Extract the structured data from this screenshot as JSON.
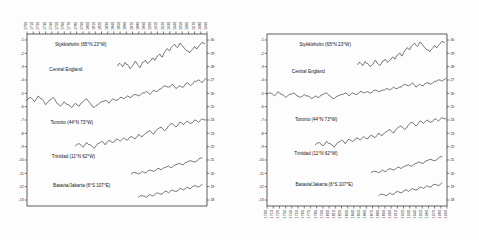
{
  "figure": {
    "title": "",
    "panels": [
      "left",
      "right"
    ]
  },
  "chart_data": {
    "type": "line",
    "title": "",
    "xlabel": "",
    "ylabel": "Temperature (°C)",
    "grid": false,
    "legend_position": "inline-labels",
    "panels": [
      {
        "name": "left",
        "xlabel_position": "top",
        "xlim": [
          1700,
          1990
        ],
        "x_ticks": [
          1700,
          1710,
          1720,
          1730,
          1740,
          1750,
          1760,
          1770,
          1780,
          1790,
          1800,
          1810,
          1820,
          1830,
          1840,
          1850,
          1860,
          1870,
          1880,
          1890,
          1900,
          1910,
          1920,
          1930,
          1940,
          1950,
          1960,
          1970,
          1980,
          1990
        ],
        "x_tick_labels": [
          "1700",
          "1710",
          "1720",
          "1730",
          "1740",
          "1750",
          "1760",
          "1770",
          "1780",
          "1790",
          "1800",
          "1810",
          "1820",
          "1830",
          "1840",
          "1850",
          "1860",
          "1870",
          "1880",
          "1890",
          "1900",
          "1910",
          "1920",
          "1930",
          "1940",
          "1950",
          "1960",
          "1970",
          "1980",
          "1990"
        ],
        "y_left_ticks": [
          -1,
          -2,
          -3,
          -4,
          -5,
          -6,
          -7,
          -8,
          -9,
          -10,
          -11,
          -12,
          -13
        ],
        "y_left_tick_labels": [
          "-1",
          "-2",
          "-3",
          "-4",
          "-5",
          "-6",
          "-7",
          "-8",
          "-9",
          "-10",
          "-11",
          "-12",
          "-13"
        ],
        "y_right_ticks": [
          30,
          29,
          28,
          27,
          26,
          25,
          24,
          23,
          22,
          21,
          20,
          19,
          18
        ],
        "y_right_tick_labels": [
          "30",
          "29",
          "28",
          "27",
          "26",
          "25",
          "24",
          "23",
          "22",
          "21",
          "20",
          "19",
          "18"
        ],
        "series": [
          {
            "name": "Stykkisholm (65°N 23°W)",
            "label": "Stykkisholm (65°N 23°W)",
            "label_x": 1745,
            "label_y_px": 46,
            "x": [
              1846,
              1850,
              1854,
              1858,
              1862,
              1866,
              1870,
              1874,
              1878,
              1882,
              1886,
              1890,
              1894,
              1898,
              1902,
              1906,
              1910,
              1914,
              1918,
              1922,
              1926,
              1930,
              1934,
              1938,
              1942,
              1946,
              1950,
              1954,
              1958,
              1962,
              1966,
              1970,
              1974,
              1978,
              1982,
              1986
            ],
            "values": [
              3.0,
              3.2,
              2.9,
              3.3,
              3.1,
              2.7,
              3.0,
              3.4,
              3.1,
              2.8,
              3.3,
              3.5,
              3.2,
              3.4,
              3.7,
              3.5,
              3.9,
              4.1,
              3.8,
              4.3,
              4.6,
              4.4,
              4.8,
              5.0,
              4.7,
              5.1,
              4.9,
              4.6,
              4.4,
              4.2,
              4.5,
              4.8,
              4.6,
              4.9,
              5.2,
              5.1
            ]
          },
          {
            "name": "Central England",
            "label": "Central England",
            "label_x": 1736,
            "label_y_px": 71,
            "x": [
              1700,
              1706,
              1712,
              1718,
              1724,
              1730,
              1736,
              1742,
              1748,
              1754,
              1760,
              1766,
              1772,
              1778,
              1784,
              1790,
              1796,
              1802,
              1808,
              1814,
              1820,
              1826,
              1832,
              1838,
              1844,
              1850,
              1856,
              1862,
              1868,
              1874,
              1880,
              1886,
              1892,
              1898,
              1904,
              1910,
              1916,
              1922,
              1928,
              1934,
              1940,
              1946,
              1952,
              1958,
              1964,
              1970,
              1976,
              1982,
              1988
            ],
            "values": [
              9.0,
              9.2,
              8.9,
              9.3,
              9.1,
              8.7,
              9.0,
              9.2,
              8.8,
              8.6,
              8.9,
              8.7,
              8.5,
              8.8,
              8.6,
              8.9,
              9.1,
              8.8,
              8.5,
              8.7,
              8.9,
              9.0,
              8.8,
              9.1,
              9.0,
              9.2,
              9.1,
              9.3,
              9.2,
              9.4,
              9.3,
              9.5,
              9.6,
              9.4,
              9.7,
              9.6,
              9.8,
              10.0,
              9.9,
              10.1,
              9.8,
              10.0,
              9.9,
              10.2,
              10.0,
              10.3,
              10.4,
              10.2,
              10.5
            ]
          },
          {
            "name": "Toronto (44°N 73°W)",
            "label": "Toronto (44°N 73°W)",
            "label_x": 1738,
            "label_y_px": 124,
            "x": [
              1778,
              1784,
              1790,
              1796,
              1802,
              1808,
              1814,
              1820,
              1826,
              1832,
              1838,
              1844,
              1850,
              1856,
              1862,
              1868,
              1874,
              1880,
              1886,
              1892,
              1898,
              1904,
              1910,
              1916,
              1922,
              1928,
              1934,
              1940,
              1946,
              1952,
              1958,
              1964,
              1970,
              1976,
              1982,
              1988
            ],
            "values": [
              6.8,
              7.0,
              6.7,
              7.1,
              6.9,
              6.6,
              7.0,
              7.2,
              6.9,
              7.3,
              7.1,
              7.4,
              7.2,
              7.5,
              7.3,
              7.6,
              7.4,
              7.8,
              7.6,
              7.9,
              8.1,
              7.8,
              8.2,
              8.4,
              8.1,
              8.5,
              8.7,
              8.4,
              8.8,
              8.6,
              8.9,
              8.7,
              9.0,
              8.8,
              9.1,
              9.0
            ]
          },
          {
            "name": "Trinidad (11°N 62°W)",
            "label": "Trinidad (11°N 62°W)",
            "label_x": 1740,
            "label_y_px": 158,
            "x": [
              1868,
              1874,
              1880,
              1886,
              1892,
              1898,
              1904,
              1910,
              1916,
              1922,
              1928,
              1934,
              1940,
              1946,
              1952,
              1958,
              1964,
              1970,
              1976,
              1982
            ],
            "values": [
              25.4,
              25.5,
              25.4,
              25.6,
              25.5,
              25.7,
              25.6,
              25.8,
              25.7,
              25.9,
              26.0,
              25.9,
              26.1,
              26.2,
              26.1,
              26.3,
              26.4,
              26.3,
              26.5,
              26.6
            ]
          },
          {
            "name": "Batavia/Jakarta (6°S 107°E)",
            "label": "Batavia/Jakarta (6°S 107°E)",
            "label_x": 1742,
            "label_y_px": 187,
            "x": [
              1880,
              1886,
              1892,
              1898,
              1904,
              1910,
              1916,
              1922,
              1928,
              1934,
              1940,
              1946,
              1952,
              1958,
              1964,
              1970,
              1976,
              1982
            ],
            "values": [
              25.8,
              25.9,
              25.8,
              26.0,
              25.9,
              26.1,
              26.0,
              26.2,
              26.1,
              26.3,
              26.2,
              26.4,
              26.3,
              26.5,
              26.4,
              26.6,
              26.5,
              26.7
            ]
          }
        ]
      },
      {
        "name": "right",
        "xlabel_position": "bottom",
        "xlim": [
          1700,
          1990
        ],
        "x_ticks": [
          1700,
          1710,
          1720,
          1730,
          1740,
          1750,
          1760,
          1770,
          1780,
          1790,
          1800,
          1810,
          1820,
          1830,
          1840,
          1850,
          1860,
          1870,
          1880,
          1890,
          1900,
          1910,
          1920,
          1930,
          1940,
          1950,
          1960,
          1970,
          1980,
          1990
        ],
        "x_tick_labels": [
          "1700",
          "1710",
          "1720",
          "1730",
          "1740",
          "1750",
          "1760",
          "1770",
          "1780",
          "1790",
          "1800",
          "1810",
          "1820",
          "1830",
          "1840",
          "1850",
          "1860",
          "1870",
          "1880",
          "1890",
          "1900",
          "1910",
          "1920",
          "1930",
          "1940",
          "1950",
          "1960",
          "1970",
          "1980",
          "1990"
        ],
        "y_left_ticks": [
          -1,
          -2,
          -3,
          -4,
          -5,
          -6,
          -7,
          -8,
          -9,
          -10,
          -11,
          -12,
          -13
        ],
        "y_left_tick_labels": [
          "-1",
          "-2",
          "-3",
          "-4",
          "-5",
          "-6",
          "-7",
          "-8",
          "-9",
          "-10",
          "-11",
          "-12",
          "-13"
        ],
        "y_right_ticks": [
          30,
          29,
          28,
          27,
          26,
          25,
          24,
          23,
          22,
          21,
          20,
          19,
          18
        ],
        "y_right_tick_labels": [
          "30",
          "29",
          "28",
          "27",
          "26",
          "25",
          "24",
          "23",
          "22",
          "21",
          "20",
          "19",
          "18"
        ],
        "series": [
          {
            "name": "Stykkisholm (65°N 23°W)",
            "label": "Stykkisholm (65°N 23°W)",
            "label_x": 1752,
            "label_y_px": 46,
            "x": [
              1846,
              1850,
              1854,
              1858,
              1862,
              1866,
              1870,
              1874,
              1878,
              1882,
              1886,
              1890,
              1894,
              1898,
              1902,
              1906,
              1910,
              1914,
              1918,
              1922,
              1926,
              1930,
              1934,
              1938,
              1942,
              1946,
              1950,
              1954,
              1958,
              1962,
              1966,
              1970,
              1974,
              1978,
              1982,
              1986
            ],
            "values": [
              3.1,
              3.3,
              3.0,
              3.4,
              3.2,
              2.9,
              3.1,
              3.5,
              3.2,
              3.0,
              3.4,
              3.6,
              3.3,
              3.5,
              3.8,
              3.6,
              4.0,
              4.2,
              3.9,
              4.4,
              4.7,
              4.5,
              4.9,
              5.1,
              4.8,
              5.2,
              5.0,
              4.7,
              4.5,
              4.3,
              4.6,
              4.9,
              4.7,
              5.0,
              5.3,
              5.2
            ]
          },
          {
            "name": "Central England",
            "label": "Central England",
            "label_x": 1740,
            "label_y_px": 73,
            "x": [
              1700,
              1706,
              1712,
              1718,
              1724,
              1730,
              1736,
              1742,
              1748,
              1754,
              1760,
              1766,
              1772,
              1778,
              1784,
              1790,
              1796,
              1802,
              1808,
              1814,
              1820,
              1826,
              1832,
              1838,
              1844,
              1850,
              1856,
              1862,
              1868,
              1874,
              1880,
              1886,
              1892,
              1898,
              1904,
              1910,
              1916,
              1922,
              1928,
              1934,
              1940,
              1946,
              1952,
              1958,
              1964,
              1970,
              1976,
              1982,
              1988
            ],
            "values": [
              9.4,
              9.5,
              9.3,
              9.6,
              9.4,
              9.2,
              9.4,
              9.5,
              9.3,
              9.2,
              9.4,
              9.3,
              9.1,
              9.3,
              9.2,
              9.4,
              9.5,
              9.3,
              9.1,
              9.3,
              9.4,
              9.5,
              9.3,
              9.5,
              9.4,
              9.6,
              9.5,
              9.6,
              9.5,
              9.7,
              9.6,
              9.7,
              9.8,
              9.7,
              9.9,
              9.8,
              9.9,
              10.1,
              10.0,
              10.2,
              9.9,
              10.1,
              10.0,
              10.2,
              10.1,
              10.3,
              10.4,
              10.3,
              10.5
            ]
          },
          {
            "name": "Toronto (44°N 73°W)",
            "label": "Toronto (44°N 73°W)",
            "label_x": 1745,
            "label_y_px": 121,
            "x": [
              1778,
              1784,
              1790,
              1796,
              1802,
              1808,
              1814,
              1820,
              1826,
              1832,
              1838,
              1844,
              1850,
              1856,
              1862,
              1868,
              1874,
              1880,
              1886,
              1892,
              1898,
              1904,
              1910,
              1916,
              1922,
              1928,
              1934,
              1940,
              1946,
              1952,
              1958,
              1964,
              1970,
              1976,
              1982,
              1988
            ],
            "values": [
              6.9,
              7.1,
              6.8,
              7.2,
              7.0,
              6.7,
              7.1,
              7.3,
              7.0,
              7.4,
              7.2,
              7.5,
              7.3,
              7.6,
              7.4,
              7.7,
              7.5,
              7.9,
              7.7,
              8.0,
              8.2,
              7.9,
              8.3,
              8.5,
              8.2,
              8.6,
              8.8,
              8.5,
              8.9,
              8.7,
              9.0,
              8.8,
              9.1,
              8.9,
              9.2,
              9.1
            ]
          },
          {
            "name": "Trinidad (11°N 62°W)",
            "label": "Trinidad (11°N 62°W)",
            "label_x": 1744,
            "label_y_px": 155,
            "x": [
              1868,
              1874,
              1880,
              1886,
              1892,
              1898,
              1904,
              1910,
              1916,
              1922,
              1928,
              1934,
              1940,
              1946,
              1952,
              1958,
              1964,
              1970,
              1976,
              1982
            ],
            "values": [
              25.5,
              25.6,
              25.5,
              25.7,
              25.6,
              25.8,
              25.7,
              25.9,
              25.8,
              26.0,
              26.1,
              26.0,
              26.2,
              26.3,
              26.2,
              26.4,
              26.5,
              26.4,
              26.6,
              26.7
            ]
          },
          {
            "name": "Batavia/Jakarta (6°S 107°E)",
            "label": "Batavia/Jakarta (6°S 107°E)",
            "label_x": 1746,
            "label_y_px": 186,
            "x": [
              1880,
              1886,
              1892,
              1898,
              1904,
              1910,
              1916,
              1922,
              1928,
              1934,
              1940,
              1946,
              1952,
              1958,
              1964,
              1970,
              1976,
              1982
            ],
            "values": [
              25.9,
              26.0,
              25.9,
              26.1,
              26.0,
              26.2,
              26.1,
              26.3,
              26.2,
              26.4,
              26.3,
              26.5,
              26.4,
              26.6,
              26.5,
              26.7,
              26.6,
              26.8
            ]
          }
        ]
      }
    ]
  }
}
